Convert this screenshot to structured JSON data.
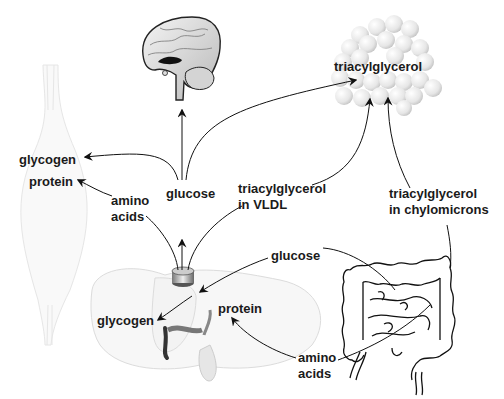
{
  "diagram": {
    "type": "metabolic-fuel-flow",
    "organs": {
      "brain": "brain",
      "muscle": "muscle",
      "adipose": "adipose tissue",
      "liver": "liver",
      "intestine": "intestine"
    },
    "labels": {
      "adipose_triacylglycerol": "triacylglycerol",
      "muscle_glycogen": "glycogen",
      "muscle_protein": "protein",
      "blood_amino_line1": "amino",
      "blood_amino_line2": "acids",
      "blood_glucose": "glucose",
      "vldl_line1": "triacylglycerol",
      "vldl_line2": "in VLDL",
      "chylo_line1": "triacylglycerol",
      "chylo_line2": "in chylomicrons",
      "gut_glucose": "glucose",
      "liver_glycogen": "glycogen",
      "liver_protein": "protein",
      "gut_amino_line1": "amino",
      "gut_amino_line2": "acids"
    },
    "colors": {
      "text": "#1a1a1a",
      "arrow": "#111111",
      "line": "#333333",
      "organ_fill_light": "#f2f2f2",
      "organ_outline": "#222222"
    }
  }
}
